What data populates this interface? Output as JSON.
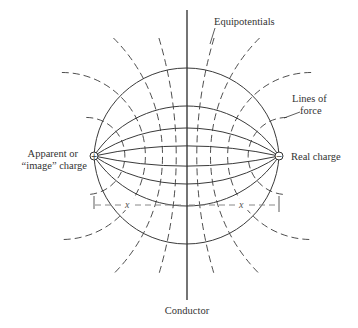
{
  "diagram": {
    "labels": {
      "equipotentials": "Equipotentials",
      "lines_of_force_1": "Lines of",
      "lines_of_force_2": "force",
      "apparent_1": "Apparent or",
      "apparent_2": "“image” charge",
      "real_charge": "Real charge",
      "conductor": "Conductor",
      "distance_left": "x",
      "distance_right": "x"
    },
    "charges": {
      "image_sign": "+",
      "real_sign": "−"
    },
    "field_line_count_per_side": 4,
    "equipotential_count_per_side": 4
  }
}
